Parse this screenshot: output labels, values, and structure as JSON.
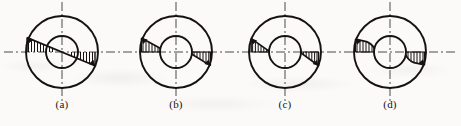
{
  "figure": {
    "type": "engineering-diagram",
    "background_color": "#fbfaf8",
    "ink_color": "#15120f",
    "centerline_color": "#4a4a4a",
    "panel_count": 4,
    "geometry": {
      "outer_radius": 36,
      "inner_radius": 16,
      "center_y": 52,
      "centerline_extension": 14,
      "stroke_width_outline": 1.9,
      "stroke_width_hatch": 1.0
    },
    "centerlines": {
      "horizontal_label": "horizontal-centerline",
      "vertical_label": "vertical-centerline",
      "dash_pattern": "9 3 2 3"
    },
    "panels": [
      {
        "id": "a",
        "label": "(a)",
        "center_x": 62,
        "label_x": 62,
        "label_y": 104,
        "distribution": "linear-antisymmetric-through-center",
        "hatch_count_upper": 8,
        "hatch_count_lower": 7,
        "peak_left": 15,
        "peak_right": 15,
        "arrow_left": "up-left",
        "arrow_right": "down-right"
      },
      {
        "id": "b",
        "label": "(b)",
        "center_x": 176,
        "label_x": 176,
        "label_y": 104,
        "distribution": "two-wedges-tangent-to-inner-circle",
        "hatch_count_upper": 7,
        "hatch_count_lower": 6,
        "peak_left": 15,
        "peak_right": 15,
        "arrow_left": "up-left",
        "arrow_right": "down-right"
      },
      {
        "id": "c",
        "label": "(c)",
        "center_x": 285,
        "label_x": 285,
        "label_y": 104,
        "distribution": "short-triangles-near-outer-wall",
        "hatch_count_upper": 5,
        "hatch_count_lower": 6,
        "peak_left": 14,
        "peak_right": 14,
        "arrow_left": "up-left",
        "arrow_right": "down-right"
      },
      {
        "id": "d",
        "label": "(d)",
        "center_x": 390,
        "label_x": 390,
        "label_y": 104,
        "distribution": "blunt-rectangular-blocks",
        "hatch_count_upper": 6,
        "hatch_count_lower": 6,
        "peak_left": 13,
        "peak_right": 13,
        "arrow_left": "up-left",
        "arrow_right": "down-right"
      }
    ]
  }
}
